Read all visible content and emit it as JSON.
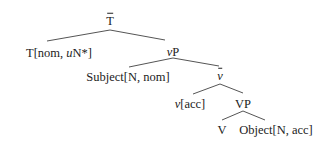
{
  "diagram": {
    "type": "syntax-tree",
    "nodes": {
      "tbar": {
        "label": "T",
        "decoration": "bar"
      },
      "t_head": {
        "pre": "T[nom, ",
        "italic": "u",
        "post": "N*]"
      },
      "vp_little": {
        "italic": "v",
        "post": "P"
      },
      "subject": {
        "label": "Subject[N, nom]"
      },
      "vbar": {
        "italic": "v",
        "decoration": "bar"
      },
      "v_head": {
        "italic": "v",
        "post": "[acc]"
      },
      "vp_big": {
        "label": "VP"
      },
      "verb": {
        "label": "V"
      },
      "object": {
        "label": "Object[N, acc]"
      }
    },
    "edges": [
      [
        "tbar",
        "t_head"
      ],
      [
        "tbar",
        "vp_little"
      ],
      [
        "vp_little",
        "subject"
      ],
      [
        "vp_little",
        "vbar"
      ],
      [
        "vbar",
        "v_head"
      ],
      [
        "vbar",
        "vp_big"
      ],
      [
        "vp_big",
        "verb"
      ],
      [
        "vp_big",
        "object"
      ]
    ],
    "line_color": "#555555",
    "text_color": "#222222"
  }
}
